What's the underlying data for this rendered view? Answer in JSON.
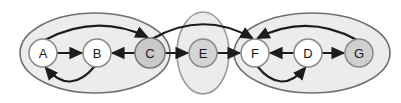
{
  "diagram": {
    "type": "graph",
    "background": "#ffffff",
    "edge_color": "#1c1c1c",
    "label_color": "#1a1a1a",
    "groups": [
      {
        "name": "left-group",
        "members": [
          "A",
          "B",
          "C"
        ],
        "cx": 95,
        "cy": 53,
        "rx": 75,
        "ry": 40,
        "fill": "#ececec",
        "stroke": "#6f6f6f"
      },
      {
        "name": "middle-group",
        "members": [
          "E"
        ],
        "cx": 203,
        "cy": 53,
        "rx": 26,
        "ry": 41,
        "fill": "#ececec",
        "stroke": "#9b9b9b"
      },
      {
        "name": "right-group",
        "members": [
          "F",
          "D",
          "G"
        ],
        "cx": 312,
        "cy": 53,
        "rx": 78,
        "ry": 40,
        "fill": "#ececec",
        "stroke": "#6f6f6f"
      }
    ],
    "nodes": [
      {
        "id": "A",
        "label": "A",
        "x": 43,
        "y": 53,
        "r": 14,
        "fill": "#ffffff",
        "stroke": "#8a8a8a"
      },
      {
        "id": "B",
        "label": "B",
        "x": 97,
        "y": 53,
        "r": 14,
        "fill": "#ffffff",
        "stroke": "#8a8a8a"
      },
      {
        "id": "C",
        "label": "C",
        "x": 150,
        "y": 53,
        "r": 15,
        "fill": "#c9c9c9",
        "stroke": "#777777"
      },
      {
        "id": "E",
        "label": "E",
        "x": 203,
        "y": 53,
        "r": 14,
        "fill": "#d4d4d4",
        "stroke": "#8a8a8a"
      },
      {
        "id": "F",
        "label": "F",
        "x": 255,
        "y": 53,
        "r": 14,
        "fill": "#ffffff",
        "stroke": "#8a8a8a"
      },
      {
        "id": "D",
        "label": "D",
        "x": 308,
        "y": 53,
        "r": 14,
        "fill": "#ffffff",
        "stroke": "#8a8a8a"
      },
      {
        "id": "G",
        "label": "G",
        "x": 359,
        "y": 53,
        "r": 14,
        "fill": "#cfcfcf",
        "stroke": "#8a8a8a"
      }
    ],
    "edges": [
      {
        "from": "A",
        "to": "B",
        "style": "straight"
      },
      {
        "from": "C",
        "to": "B",
        "style": "straight"
      },
      {
        "from": "C",
        "to": "E",
        "style": "straight"
      },
      {
        "from": "E",
        "to": "F",
        "style": "straight"
      },
      {
        "from": "D",
        "to": "F",
        "style": "straight"
      },
      {
        "from": "D",
        "to": "G",
        "style": "straight"
      },
      {
        "from": "A",
        "to": "C",
        "style": "arc-top"
      },
      {
        "from": "C",
        "to": "F",
        "style": "arc-top-long"
      },
      {
        "from": "G",
        "to": "F",
        "style": "arc-top"
      },
      {
        "from": "B",
        "to": "A",
        "style": "arc-bottom"
      },
      {
        "from": "F",
        "to": "D",
        "style": "arc-bottom"
      }
    ]
  }
}
